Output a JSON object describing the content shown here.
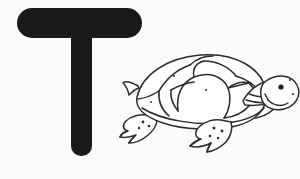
{
  "card": {
    "kind": "alphabet-flashcard",
    "background_color": "#fbfbf9",
    "ink_color": "#1a1a1a",
    "outline_color": "#2b2b2b"
  },
  "letter": {
    "character": "T",
    "case": "uppercase",
    "style": "bold-rounded-sans",
    "color": "#1a1a1a",
    "crossbar": {
      "x": 17,
      "y": 8,
      "width": 125,
      "height": 30,
      "radius": 15
    },
    "stem": {
      "x": 71,
      "y": 8,
      "width": 21,
      "height": 148,
      "radius": 10
    }
  },
  "illustration": {
    "subject": "turtle",
    "label": "turtle",
    "style": "black-and-white line art",
    "facing": "right",
    "fill_color": "#ffffff",
    "stroke_color": "#2b2b2b",
    "parts": [
      "shell",
      "shell-scutes",
      "head",
      "eye",
      "mouth",
      "front-flipper",
      "rear-flipper",
      "tail"
    ]
  }
}
